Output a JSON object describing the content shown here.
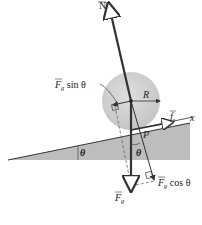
{
  "diagram": {
    "title": "",
    "colors": {
      "incline": "#bdbdbd",
      "ball": "#d4d4d4",
      "vector": "#333333",
      "dashed": "#555555",
      "background": "#ffffff"
    },
    "labels": {
      "normal_force": "N",
      "gravity_sin_component": "F",
      "gravity_sin_sub": "g",
      "gravity_sin_text": " sin θ",
      "radius": "R",
      "friction": "f",
      "friction_sub": "s",
      "x_axis": "x",
      "contact_point": "P",
      "incline_angle": "θ",
      "vertical_angle": "θ",
      "gravity_cos_component": "F",
      "gravity_cos_sub": "g",
      "gravity_cos_text": " cos θ",
      "gravity": "F",
      "gravity_sub": "g"
    }
  }
}
